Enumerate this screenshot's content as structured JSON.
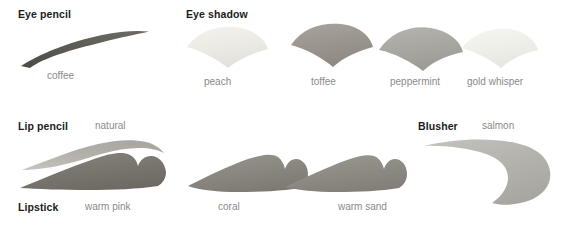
{
  "page": {
    "background": "#ffffff",
    "title_color": "#1b1b1b",
    "label_color": "#8a8a8a"
  },
  "categories": [
    {
      "id": "eye-pencil",
      "title": "Eye pencil",
      "shades": [
        {
          "name": "coffee",
          "color": "#595550",
          "swatch": "pencil-stroke"
        }
      ]
    },
    {
      "id": "eye-shadow",
      "title": "Eye shadow",
      "shades": [
        {
          "name": "peach",
          "color": "#eceae5",
          "swatch": "fan-wedge"
        },
        {
          "name": "toffee",
          "color": "#9b9790",
          "swatch": "fan-wedge"
        },
        {
          "name": "peppermint",
          "color": "#a9a8a2",
          "swatch": "fan-wedge"
        },
        {
          "name": "gold whisper",
          "color": "#eeefe9",
          "swatch": "fan-wedge"
        }
      ]
    },
    {
      "id": "lip-pencil",
      "title": "Lip pencil",
      "shades": [
        {
          "name": "natural",
          "color": "#b6b2ab",
          "swatch": "lip-outline"
        }
      ]
    },
    {
      "id": "lipstick",
      "title": "Lipstick",
      "shades": [
        {
          "name": "warm pink",
          "color": "#78746e",
          "swatch": "lip-shape"
        },
        {
          "name": "coral",
          "color": "#8a8680",
          "swatch": "lip-shape"
        },
        {
          "name": "warm sand",
          "color": "#8e8a84",
          "swatch": "lip-shape"
        }
      ]
    },
    {
      "id": "blusher",
      "title": "Blusher",
      "shades": [
        {
          "name": "salmon",
          "color": "#b5b3ad",
          "swatch": "blusher-sweep"
        }
      ]
    }
  ]
}
